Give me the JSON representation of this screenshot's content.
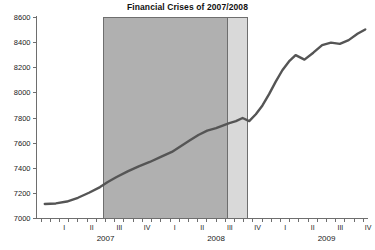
{
  "chart_data": {
    "type": "line",
    "title": "Financial Crises of 2007/2008",
    "xlabel": "",
    "ylabel": "",
    "ylim": [
      7000,
      8600
    ],
    "ytick_labels": [
      "7000",
      "7200",
      "7400",
      "7600",
      "7800",
      "8000",
      "8200",
      "8400",
      "8600"
    ],
    "ytick_values": [
      7000,
      7200,
      7400,
      7600,
      7800,
      8000,
      8200,
      8400,
      8600
    ],
    "grid": false,
    "legend": "none",
    "x_quarter_labels": [
      "I",
      "II",
      "III",
      "IV",
      "I",
      "II",
      "III",
      "IV",
      "I",
      "II",
      "III",
      "IV"
    ],
    "x_year_labels": [
      "2007",
      "2008",
      "2009"
    ],
    "xlim": [
      2006.875,
      2009.875
    ],
    "series": [
      {
        "name": "Index",
        "color": "#555555",
        "x": [
          2006.95,
          2007.05,
          2007.15,
          2007.25,
          2007.35,
          2007.45,
          2007.52,
          2007.6,
          2007.7,
          2007.8,
          2007.9,
          2008.0,
          2008.1,
          2008.18,
          2008.26,
          2008.34,
          2008.42,
          2008.5,
          2008.56,
          2008.62,
          2008.68,
          2008.74,
          2008.8,
          2008.86,
          2008.92,
          2008.98,
          2009.04,
          2009.1,
          2009.16,
          2009.22,
          2009.3,
          2009.38,
          2009.46,
          2009.54,
          2009.62,
          2009.7,
          2009.78,
          2009.85
        ],
        "values": [
          7115,
          7120,
          7135,
          7165,
          7205,
          7250,
          7290,
          7330,
          7375,
          7415,
          7450,
          7490,
          7530,
          7575,
          7620,
          7665,
          7700,
          7720,
          7740,
          7760,
          7775,
          7800,
          7775,
          7830,
          7900,
          7990,
          8090,
          8180,
          8250,
          8300,
          8265,
          8320,
          8380,
          8400,
          8390,
          8420,
          8470,
          8505
        ]
      }
    ],
    "shaded_regions": [
      {
        "name": "recession-band-dark",
        "x_start": 2007.48,
        "x_end": 2008.6,
        "color": "#b0b0b0",
        "border_color": "#6e6e6e"
      },
      {
        "name": "recession-band-light",
        "x_start": 2008.6,
        "x_end": 2008.78,
        "color": "#d9d9d9",
        "border_color": "#6e6e6e"
      }
    ]
  },
  "figure": {
    "background": "#ffffff",
    "axis_color": "#6e6e6e",
    "text_color": "#1a1a1a"
  }
}
